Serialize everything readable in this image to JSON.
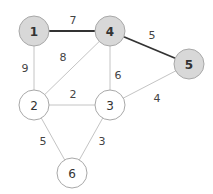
{
  "graph": {
    "highlight_fill": "#d8d8d8",
    "plain_fill": "#ffffff",
    "nodes": [
      {
        "id": "1",
        "label": "1",
        "x": 34,
        "y": 31,
        "highlighted": true
      },
      {
        "id": "4",
        "label": "4",
        "x": 110,
        "y": 31,
        "highlighted": true
      },
      {
        "id": "5",
        "label": "5",
        "x": 189,
        "y": 64,
        "highlighted": true
      },
      {
        "id": "2",
        "label": "2",
        "x": 34,
        "y": 105,
        "highlighted": false
      },
      {
        "id": "3",
        "label": "3",
        "x": 110,
        "y": 105,
        "highlighted": false
      },
      {
        "id": "6",
        "label": "6",
        "x": 72,
        "y": 173,
        "highlighted": false
      }
    ],
    "edges": [
      {
        "from": "1",
        "to": "4",
        "weight": "7",
        "bold": true,
        "lx": 73,
        "ly": 20
      },
      {
        "from": "4",
        "to": "5",
        "weight": "5",
        "bold": true,
        "lx": 152,
        "ly": 35
      },
      {
        "from": "1",
        "to": "2",
        "weight": "9",
        "bold": false,
        "lx": 25,
        "ly": 68
      },
      {
        "from": "4",
        "to": "2",
        "weight": "8",
        "bold": false,
        "lx": 63,
        "ly": 57
      },
      {
        "from": "4",
        "to": "3",
        "weight": "6",
        "bold": false,
        "lx": 118,
        "ly": 75
      },
      {
        "from": "5",
        "to": "3",
        "weight": "4",
        "bold": false,
        "lx": 157,
        "ly": 98
      },
      {
        "from": "2",
        "to": "3",
        "weight": "2",
        "bold": false,
        "lx": 73,
        "ly": 94
      },
      {
        "from": "2",
        "to": "6",
        "weight": "5",
        "bold": false,
        "lx": 43,
        "ly": 141
      },
      {
        "from": "3",
        "to": "6",
        "weight": "3",
        "bold": false,
        "lx": 102,
        "ly": 141
      }
    ]
  }
}
